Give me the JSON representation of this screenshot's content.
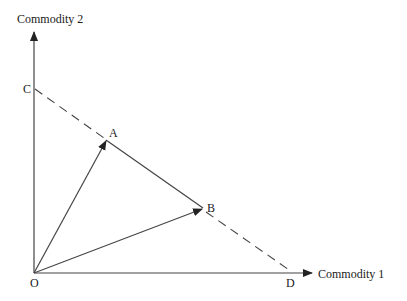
{
  "diagram": {
    "axes": {
      "y_label": "Commodity 2",
      "x_label": "Commodity 1"
    },
    "points": {
      "origin": "O",
      "C": "C",
      "A": "A",
      "B": "B",
      "D": "D"
    },
    "lines": [
      {
        "from": "O",
        "to": "A",
        "style": "arrow"
      },
      {
        "from": "O",
        "to": "B",
        "style": "arrow"
      },
      {
        "from": "A",
        "to": "B",
        "style": "solid"
      },
      {
        "from": "C",
        "to": "A",
        "style": "dashed"
      },
      {
        "from": "B",
        "to": "D",
        "style": "dashed"
      }
    ],
    "colors": {
      "line": "#333333",
      "background": "#ffffff"
    }
  }
}
